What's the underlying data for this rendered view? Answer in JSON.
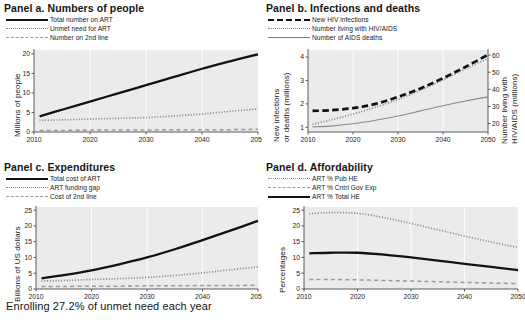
{
  "figure": {
    "caption": "Enrolling 27.2% of unmet need each year"
  },
  "panels": [
    {
      "id": "a",
      "title": "Panel a. Numbers of people",
      "legend": [
        {
          "label": "Total number on ART",
          "style": "solid"
        },
        {
          "label": "Unmet need for ART",
          "style": "dotted"
        },
        {
          "label": "Number on 2nd line",
          "style": "dashed"
        }
      ],
      "chart_data": {
        "type": "line",
        "title": "Panel a. Numbers of people",
        "xlabel": "",
        "ylabel": "Millions of people",
        "xlim": [
          2010,
          2050
        ],
        "ylim": [
          0,
          21
        ],
        "yticks": [
          0,
          5,
          10,
          15,
          20
        ],
        "xticks": [
          2010,
          2020,
          2030,
          2040,
          2050
        ],
        "grid": "vertical-white",
        "legend_position": "above-plot",
        "x": [
          2011,
          2015,
          2020,
          2025,
          2030,
          2035,
          2040,
          2045,
          2050
        ],
        "series": [
          {
            "name": "Total number on ART",
            "style": "solid",
            "values": [
              4.0,
              5.7,
              7.8,
              9.9,
              12.0,
              14.1,
              16.2,
              18.1,
              19.9
            ]
          },
          {
            "name": "Unmet need for ART",
            "style": "dotted",
            "values": [
              3.0,
              3.1,
              3.3,
              3.5,
              3.7,
              4.1,
              4.6,
              5.3,
              5.9
            ]
          },
          {
            "name": "Number on 2nd line",
            "style": "dashed",
            "values": [
              0.4,
              0.4,
              0.5,
              0.5,
              0.5,
              0.6,
              0.6,
              0.6,
              0.7
            ]
          }
        ]
      }
    },
    {
      "id": "b",
      "title": "Panel b. Infections and deaths",
      "legend": [
        {
          "label": "New HIV infections",
          "style": "dashed-bold"
        },
        {
          "label": "Number living with HIV/AIDS",
          "style": "dotted"
        },
        {
          "label": "Number of AIDS deaths",
          "style": "solid-thin"
        }
      ],
      "chart_data": {
        "type": "line",
        "title": "Panel b. Infections and deaths",
        "xlabel": "",
        "ylabel": "New infections or deaths (millions)",
        "ylabel_right": "Number living with HIV/AIDS (millions)",
        "xlim": [
          2010,
          2050
        ],
        "ylim": [
          0.8,
          4.3
        ],
        "ylim_right": [
          15,
          63
        ],
        "yticks": [
          1,
          2,
          3,
          4
        ],
        "yticks_right": [
          20,
          30,
          40,
          50,
          60
        ],
        "xticks": [
          2010,
          2020,
          2030,
          2040,
          2050
        ],
        "grid": "vertical-white",
        "legend_position": "above-plot",
        "x": [
          2011,
          2015,
          2020,
          2025,
          2030,
          2035,
          2040,
          2045,
          2050
        ],
        "series": [
          {
            "name": "New HIV infections",
            "style": "dashed-bold",
            "axis": "left",
            "values": [
              1.7,
              1.73,
              1.82,
              2.0,
              2.3,
              2.66,
              3.1,
              3.58,
              4.1
            ]
          },
          {
            "name": "Number living with HIV/AIDS",
            "style": "dotted",
            "axis": "right",
            "values": [
              19.5,
              22.0,
              25.5,
              29.5,
              34.0,
              39.5,
              45.5,
              52.0,
              58.0
            ]
          },
          {
            "name": "Number of AIDS deaths",
            "style": "solid-thin",
            "axis": "left",
            "values": [
              1.02,
              1.05,
              1.15,
              1.3,
              1.48,
              1.7,
              1.92,
              2.12,
              2.3
            ]
          }
        ]
      }
    },
    {
      "id": "c",
      "title": "Panel c. Expenditures",
      "legend": [
        {
          "label": "Total cost of ART",
          "style": "solid"
        },
        {
          "label": "ART funding gap",
          "style": "dotted"
        },
        {
          "label": "Cost of 2nd line",
          "style": "dashed"
        }
      ],
      "chart_data": {
        "type": "line",
        "title": "Panel c. Expenditures",
        "xlabel": "",
        "ylabel": "Billions of  US dollars",
        "xlim": [
          2010,
          2050
        ],
        "ylim": [
          0,
          26
        ],
        "yticks": [
          0,
          5,
          10,
          15,
          20,
          25
        ],
        "xticks": [
          2010,
          2020,
          2030,
          2040,
          2050
        ],
        "grid": "vertical-white",
        "legend_position": "above-plot",
        "x": [
          2011,
          2015,
          2020,
          2025,
          2030,
          2035,
          2040,
          2045,
          2050
        ],
        "series": [
          {
            "name": "Total cost of ART",
            "style": "solid",
            "values": [
              3.4,
              4.4,
              5.9,
              7.8,
              10.0,
              12.6,
              15.5,
              18.5,
              21.6
            ]
          },
          {
            "name": "ART funding gap",
            "style": "dotted",
            "values": [
              2.5,
              2.7,
              3.0,
              3.3,
              3.7,
              4.3,
              5.1,
              6.1,
              7.0
            ]
          },
          {
            "name": "Cost of 2nd line",
            "style": "dashed",
            "values": [
              0.8,
              0.8,
              0.9,
              0.9,
              1.0,
              1.0,
              1.1,
              1.1,
              1.2
            ]
          }
        ]
      }
    },
    {
      "id": "d",
      "title": "Panel d. Affordability",
      "legend": [
        {
          "label": "ART % Pub HE",
          "style": "dotted"
        },
        {
          "label": "ART % Cntrl Gov Exp",
          "style": "dashed"
        },
        {
          "label": "ART % Total HE",
          "style": "solid"
        }
      ],
      "chart_data": {
        "type": "line",
        "title": "Panel d. Affordability",
        "xlabel": "",
        "ylabel": "Percentages",
        "xlim": [
          2010,
          2050
        ],
        "ylim": [
          0,
          26
        ],
        "yticks": [
          0,
          5,
          10,
          15,
          20,
          25
        ],
        "xticks": [
          2010,
          2020,
          2030,
          2040,
          2050
        ],
        "grid": "vertical-white",
        "legend_position": "above-plot",
        "x": [
          2011,
          2015,
          2020,
          2025,
          2030,
          2035,
          2040,
          2045,
          2050
        ],
        "series": [
          {
            "name": "ART % Pub HE",
            "style": "dotted",
            "values": [
              23.9,
              24.2,
              24.0,
              22.6,
              20.8,
              18.8,
              16.8,
              14.9,
              13.2
            ]
          },
          {
            "name": "ART % Cntrl Gov Exp",
            "style": "dashed",
            "values": [
              3.0,
              3.0,
              2.9,
              2.7,
              2.5,
              2.3,
              2.1,
              1.9,
              1.7
            ]
          },
          {
            "name": "ART % Total HE",
            "style": "solid",
            "values": [
              11.3,
              11.5,
              11.5,
              10.9,
              10.0,
              9.0,
              8.0,
              7.0,
              6.0
            ]
          }
        ]
      }
    }
  ]
}
